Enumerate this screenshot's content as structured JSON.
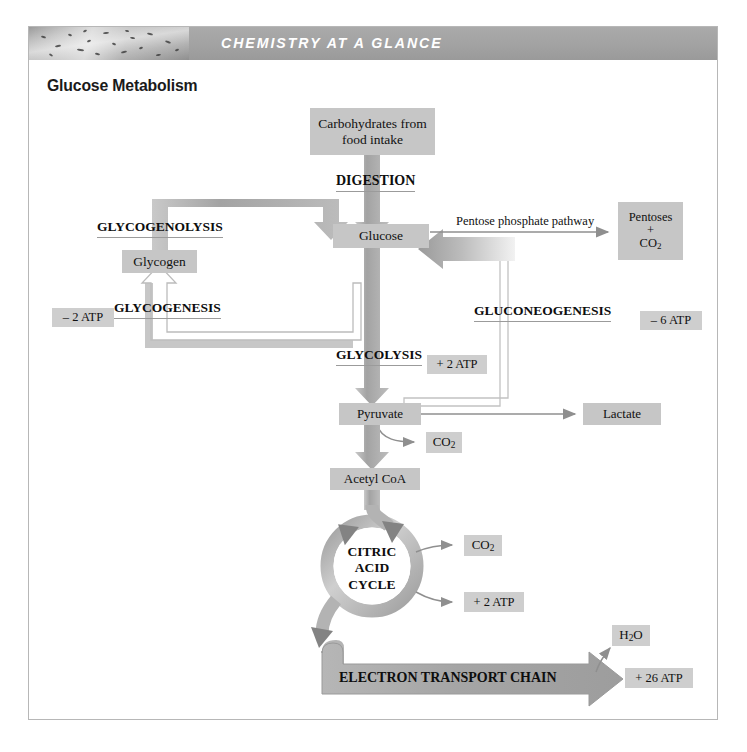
{
  "header": {
    "banner_text": "CHEMISTRY AT A GLANCE",
    "page_title": "Glucose Metabolism",
    "thumbnail_alt": "muscle-tissue-micrograph",
    "banner_color": "#a2a2a2",
    "box_fill": "#c6c6c6",
    "arrow_gray": "#a8a8a8"
  },
  "diagram": {
    "nodes": {
      "carbohydrates": "Carbohydrates from\nfood intake",
      "carbohydrates_line1": "Carbohydrates from",
      "carbohydrates_line2": "food intake",
      "glucose": "Glucose",
      "glycogen": "Glycogen",
      "pentoses_line1": "Pentoses",
      "pentoses_line2": "+",
      "pentoses_line3": "CO",
      "pentoses_sub": "2",
      "pyruvate": "Pyruvate",
      "lactate": "Lactate",
      "acetyl_coa": "Acetyl CoA",
      "co2_pyruvate": "CO",
      "co2_pyruvate_sub": "2",
      "co2_cycle": "CO",
      "co2_cycle_sub": "2",
      "h2o": "H",
      "h2o_sub": "2",
      "h2o_tail": "O",
      "citric_line1": "CITRIC",
      "citric_line2": "ACID",
      "citric_line3": "CYCLE",
      "etc": "ELECTRON TRANSPORT CHAIN"
    },
    "pathway_labels": {
      "digestion": "DIGESTION",
      "glycogenolysis": "GLYCOGENOLYSIS",
      "glycogenesis": "GLYCOGENESIS",
      "glycolysis": "GLYCOLYSIS",
      "gluconeogenesis": "GLUCONEOGENESIS",
      "pentose_phosphate": "Pentose phosphate pathway"
    },
    "atp_tags": {
      "glycogenesis_cost": "– 2 ATP",
      "gluconeogenesis_cost": "– 6 ATP",
      "glycolysis_yield": "+ 2 ATP",
      "cycle_yield": "+ 2 ATP",
      "etc_yield": "+ 26 ATP"
    }
  }
}
